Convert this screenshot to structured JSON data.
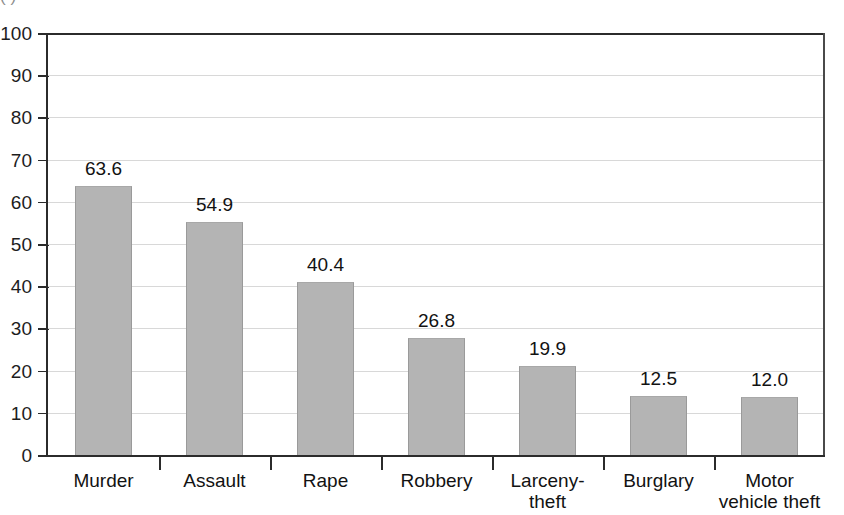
{
  "chart_data": {
    "type": "bar",
    "title": "",
    "xlabel": "",
    "ylabel": "",
    "ylim": [
      0,
      100
    ],
    "yticks": [
      0,
      10,
      20,
      30,
      40,
      50,
      60,
      70,
      80,
      90,
      100
    ],
    "grid": true,
    "legend": "none",
    "orientation": "vertical",
    "bar_color": "#b4b4b4",
    "categories": [
      "Murder",
      "Assault",
      "Rape",
      "Robbery",
      "Larceny-\ntheft",
      "Burglary",
      "Motor\nvehicle theft"
    ],
    "values": [
      63.6,
      54.9,
      40.4,
      26.8,
      19.9,
      12.5,
      12.0
    ],
    "value_labels": [
      "63.6",
      "54.9",
      "40.4",
      "26.8",
      "19.9",
      "12.5",
      "12.0"
    ],
    "bars": [
      {
        "category": "Murder",
        "value": 63.6,
        "label": "63.6",
        "drawn_height_pct": 63.7
      },
      {
        "category": "Assault",
        "value": 54.9,
        "label": "54.9",
        "drawn_height_pct": 55.2
      },
      {
        "category": "Rape",
        "value": 40.4,
        "label": "40.4",
        "drawn_height_pct": 41.0
      },
      {
        "category": "Robbery",
        "value": 26.8,
        "label": "26.8",
        "drawn_height_pct": 27.8
      },
      {
        "category": "Larceny-theft",
        "value": 19.9,
        "label": "19.9",
        "drawn_height_pct": 21.2
      },
      {
        "category": "Burglary",
        "value": 12.5,
        "label": "12.5",
        "drawn_height_pct": 14.0
      },
      {
        "category": "Motor vehicle theft",
        "value": 12.0,
        "label": "12.0",
        "drawn_height_pct": 13.7
      }
    ]
  },
  "axes": {
    "y_tick_labels": [
      "100",
      "90",
      "80",
      "70",
      "60",
      "50",
      "40",
      "30",
      "20",
      "10",
      "0"
    ]
  },
  "caption_fragment": "(  )"
}
